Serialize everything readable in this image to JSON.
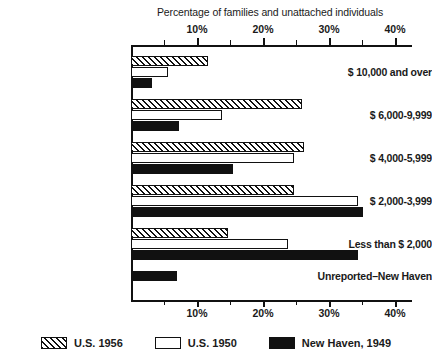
{
  "chart_data": {
    "type": "bar",
    "orientation": "horizontal",
    "title": "",
    "xlabel": "Percentage of families and unattached individuals",
    "ylabel": "",
    "xlim": [
      0,
      42
    ],
    "xticks": [
      0,
      5,
      10,
      15,
      20,
      25,
      30,
      35,
      40
    ],
    "xticklabels": [
      "",
      "",
      "10%",
      "",
      "20%",
      "",
      "30%",
      "",
      "40%"
    ],
    "grid": false,
    "legend_position": "bottom",
    "categories": [
      "$ 10,000 and over",
      "$ 6,000-9,999",
      "$ 4,000-5,999",
      "$ 2,000-3,999",
      "Less than $ 2,000",
      "Unreported–New Haven"
    ],
    "series": [
      {
        "name": "U.S. 1956",
        "key": "us1956",
        "pattern": "diagonal-hatch",
        "values": [
          11.7,
          25.9,
          26.2,
          24.7,
          14.7,
          null
        ]
      },
      {
        "name": "U.S. 1950",
        "key": "us1950",
        "pattern": "open",
        "values": [
          5.6,
          13.8,
          24.7,
          34.4,
          23.8,
          null
        ]
      },
      {
        "name": "New Haven, 1949",
        "key": "newhaven",
        "pattern": "solid",
        "values": [
          3.2,
          7.3,
          15.5,
          35.1,
          34.4,
          7.0
        ]
      }
    ]
  },
  "colors": {
    "ink": "#111111",
    "paper": "#ffffff"
  }
}
